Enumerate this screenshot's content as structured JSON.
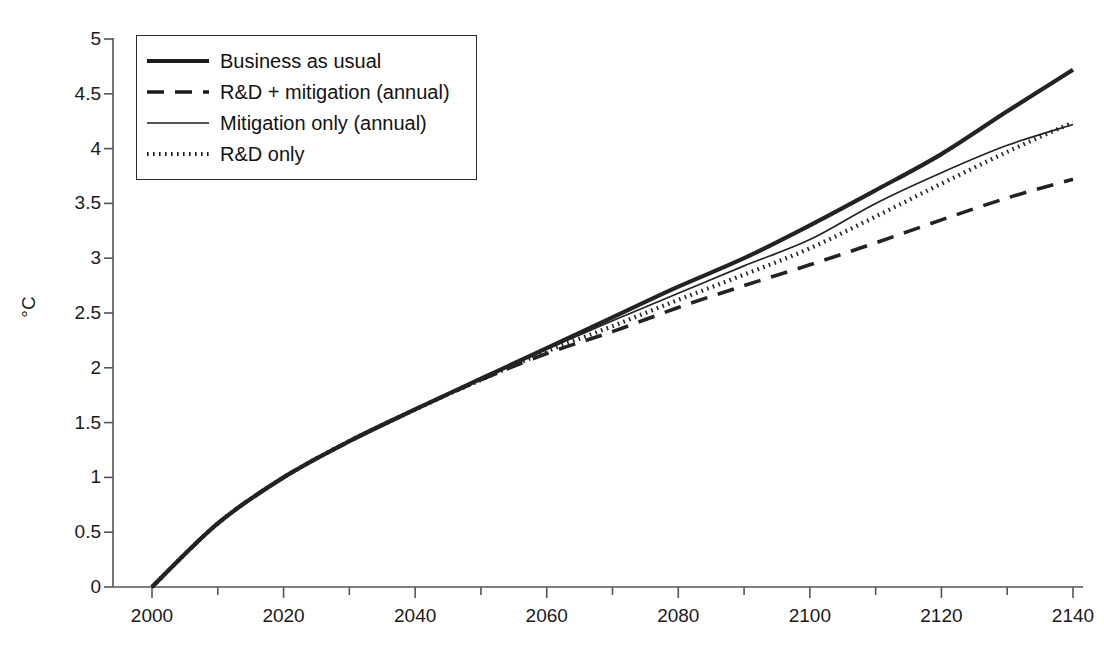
{
  "chart_data": {
    "type": "line",
    "title": "",
    "xlabel": "",
    "ylabel": "°C",
    "xlim": [
      2000,
      2140
    ],
    "ylim": [
      0,
      5
    ],
    "grid": false,
    "legend_position": "top-left",
    "x_ticks": [
      "2000",
      "2020",
      "2040",
      "2060",
      "2080",
      "2100",
      "2120",
      "2140"
    ],
    "x_minor_tick_step": 10,
    "y_ticks": [
      "0",
      "0.5",
      "1",
      "1.5",
      "2",
      "2.5",
      "3",
      "3.5",
      "4",
      "4.5",
      "5"
    ],
    "x": [
      2000,
      2010,
      2020,
      2030,
      2040,
      2050,
      2060,
      2070,
      2080,
      2090,
      2100,
      2110,
      2120,
      2130,
      2140
    ],
    "series": [
      {
        "name": "Business as usual",
        "style": "solid-thick",
        "color": "#232323",
        "values": [
          0,
          0.58,
          1.0,
          1.33,
          1.62,
          1.9,
          2.18,
          2.46,
          2.74,
          3.0,
          3.3,
          3.62,
          3.95,
          4.34,
          4.72
        ]
      },
      {
        "name": "R&D + mitigation (annual)",
        "style": "dashed",
        "color": "#232323",
        "values": [
          0,
          0.58,
          1.0,
          1.33,
          1.62,
          1.89,
          2.13,
          2.33,
          2.55,
          2.75,
          2.94,
          3.14,
          3.35,
          3.55,
          3.72
        ]
      },
      {
        "name": "Mitigation only (annual)",
        "style": "solid-thin",
        "color": "#232323",
        "values": [
          0,
          0.58,
          1.0,
          1.33,
          1.62,
          1.9,
          2.17,
          2.43,
          2.68,
          2.93,
          3.17,
          3.5,
          3.78,
          4.03,
          4.22
        ]
      },
      {
        "name": "R&D only",
        "style": "dotted",
        "color": "#232323",
        "values": [
          0,
          0.58,
          1.0,
          1.33,
          1.62,
          1.89,
          2.15,
          2.38,
          2.62,
          2.85,
          3.09,
          3.38,
          3.68,
          3.97,
          4.24
        ]
      }
    ]
  },
  "legend": {
    "items": [
      {
        "label": "Business as usual",
        "style": "solid-thick"
      },
      {
        "label": "R&D + mitigation (annual)",
        "style": "dashed"
      },
      {
        "label": "Mitigation only (annual)",
        "style": "solid-thin"
      },
      {
        "label": "R&D only",
        "style": "dotted"
      }
    ]
  },
  "axes": {
    "y_title": "°C",
    "axis_color": "#555555"
  }
}
